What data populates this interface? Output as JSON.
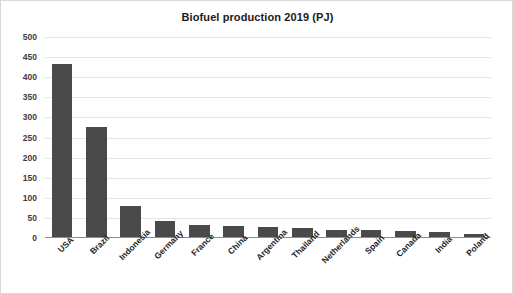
{
  "chart_data": {
    "type": "bar",
    "title": "Biofuel production 2019 (PJ)",
    "xlabel": "",
    "ylabel": "",
    "ylim": [
      0,
      500
    ],
    "yticks": [
      0,
      50,
      100,
      150,
      200,
      250,
      300,
      350,
      400,
      450,
      500
    ],
    "ytick_labels": [
      "0",
      "50",
      "100",
      "150",
      "200",
      "250",
      "300",
      "350",
      "400",
      "450",
      "500"
    ],
    "grid": true,
    "legend": false,
    "bar_color": "#4a4a4a",
    "gridline_color": "#e6e6e6",
    "axis_color": "#8c8c8c",
    "categories": [
      "USA",
      "Brazil",
      "Indonesia",
      "Germany",
      "France",
      "China",
      "Argentina",
      "Thailand",
      "Netherlands",
      "Spain",
      "Canada",
      "India",
      "Poland"
    ],
    "values": [
      432,
      275,
      79,
      42,
      33,
      30,
      27,
      25,
      21,
      19,
      17,
      14,
      11
    ]
  }
}
